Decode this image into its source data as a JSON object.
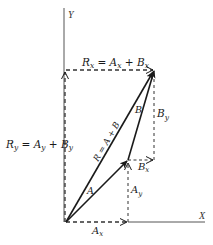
{
  "diagram": {
    "colors": {
      "ink": "#1a1a1a",
      "dash": "#333333",
      "axis": "#555555",
      "background": "#ffffff"
    },
    "axes": {
      "x_label": "X",
      "y_label": "Y"
    },
    "labels": {
      "rx_eq": "R",
      "rx_eq_sub": "x",
      "rx_eq_rest1": " = A",
      "rx_eq_sub2": "x",
      "rx_eq_rest2": " + B",
      "rx_eq_sub3": "x",
      "ry_eq": "R",
      "ry_eq_sub": "y",
      "ry_eq_rest1": " = A",
      "ry_eq_sub2": "y",
      "ry_eq_rest2": " + B",
      "ry_eq_sub3": "y",
      "resultant": "R = A + B",
      "vector_a": "A",
      "vector_b": "B",
      "by_main": "B",
      "by_sub": "y",
      "bx_main": "B",
      "bx_sub": "x",
      "ay_main": "A",
      "ay_sub": "y",
      "ax_main": "A",
      "ax_sub": "x"
    },
    "points": {
      "origin": [
        66,
        222
      ],
      "a_tip": [
        128,
        160
      ],
      "r_tip": [
        154,
        70
      ],
      "bx_corner": [
        154,
        160
      ],
      "y_axis_top": [
        64,
        8
      ],
      "x_axis_end": [
        205,
        222
      ]
    }
  }
}
